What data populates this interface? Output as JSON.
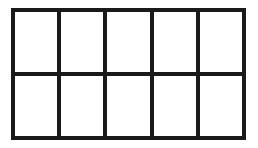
{
  "diagram": {
    "type": "grid",
    "rows": 2,
    "columns": 5,
    "line_color": "#1a1a1a",
    "cell_color": "#ffffff",
    "cells": [
      {
        "row": 1,
        "col": 1,
        "label": ""
      },
      {
        "row": 1,
        "col": 2,
        "label": ""
      },
      {
        "row": 1,
        "col": 3,
        "label": ""
      },
      {
        "row": 1,
        "col": 4,
        "label": ""
      },
      {
        "row": 1,
        "col": 5,
        "label": ""
      },
      {
        "row": 2,
        "col": 1,
        "label": ""
      },
      {
        "row": 2,
        "col": 2,
        "label": ""
      },
      {
        "row": 2,
        "col": 3,
        "label": ""
      },
      {
        "row": 2,
        "col": 4,
        "label": ""
      },
      {
        "row": 2,
        "col": 5,
        "label": ""
      }
    ]
  }
}
